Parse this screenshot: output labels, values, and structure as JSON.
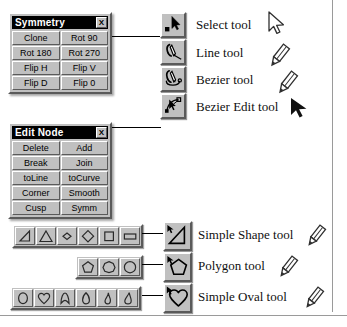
{
  "symmetry_panel": {
    "title": "Symmetry",
    "close_label": "X",
    "rows": [
      [
        "Clone",
        "Rot 90"
      ],
      [
        "Rot 180",
        "Rot 270"
      ],
      [
        "Flip H",
        "Flip V"
      ],
      [
        "Flip D",
        "Flip 0"
      ]
    ]
  },
  "editnode_panel": {
    "title": "Edit Node",
    "close_label": "X",
    "rows": [
      [
        "Delete",
        "Add"
      ],
      [
        "Break",
        "Join"
      ],
      [
        "toLine",
        "toCurve"
      ],
      [
        "Corner",
        "Smooth"
      ],
      [
        "Cusp",
        "Symm"
      ]
    ]
  },
  "tools": [
    {
      "label": "Select tool",
      "button_icon": "arrow-select-icon",
      "cursor_icon": "arrow-outline-cursor-icon"
    },
    {
      "label": "Line tool",
      "button_icon": "pen-line-icon",
      "cursor_icon": "pencil-cursor-icon"
    },
    {
      "label": "Bezier tool",
      "button_icon": "pen-bezier-icon",
      "cursor_icon": "pencil-cursor-icon"
    },
    {
      "label": "Bezier Edit tool",
      "button_icon": "bezier-node-icon",
      "cursor_icon": "arrow-solid-cursor-icon"
    }
  ],
  "shape_tools": [
    {
      "label": "Simple Shape tool",
      "button_icon": "triangle-shape-icon",
      "cursor_icon": "pencil-cursor-icon",
      "palette": [
        "right-triangle-icon",
        "equilateral-triangle-icon",
        "small-diamond-icon",
        "large-diamond-icon",
        "square-icon",
        "rectangle-icon"
      ]
    },
    {
      "label": "Polygon tool",
      "button_icon": "pentagon-shape-icon",
      "cursor_icon": "pencil-cursor-icon",
      "palette": [
        "pentagon-icon",
        "heptagon-icon",
        "circle-polygon-icon"
      ]
    },
    {
      "label": "Simple Oval tool",
      "button_icon": "heart-shape-icon",
      "cursor_icon": "pencil-cursor-icon",
      "palette": [
        "circle-icon",
        "heart-icon",
        "arch-icon",
        "vertical-oval-icon",
        "leaf-icon",
        "teardrop-icon"
      ]
    }
  ],
  "colors": {
    "face": "#c0c0c0",
    "shadow": "#5a5a5a",
    "highlight": "#ffffff",
    "titlebar": "#000000",
    "text": "#000000",
    "rule": "#9a9a9a"
  }
}
